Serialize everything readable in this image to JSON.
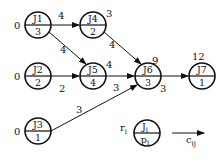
{
  "diagram": {
    "type": "job precedence graph",
    "nodes": [
      {
        "id": "J1",
        "label": "J1",
        "p": "3",
        "r": "0",
        "cx": 38,
        "cy": 25
      },
      {
        "id": "J2",
        "label": "J2",
        "p": "2",
        "r": "0",
        "cx": 38,
        "cy": 76
      },
      {
        "id": "J3",
        "label": "J3",
        "p": "1",
        "r": "0",
        "cx": 38,
        "cy": 131
      },
      {
        "id": "J4",
        "label": "J4",
        "p": "2",
        "r": "3",
        "cx": 93,
        "cy": 25
      },
      {
        "id": "J5",
        "label": "J5",
        "p": "4",
        "r": "4",
        "cx": 93,
        "cy": 76
      },
      {
        "id": "J6",
        "label": "J6",
        "p": "3",
        "r": "9",
        "cx": 148,
        "cy": 76
      },
      {
        "id": "J7",
        "label": "J7",
        "p": "1",
        "r": "12",
        "cx": 202,
        "cy": 76
      }
    ],
    "edges": [
      {
        "from": "J1",
        "to": "J4",
        "c": "4"
      },
      {
        "from": "J1",
        "to": "J5",
        "c": "4"
      },
      {
        "from": "J2",
        "to": "J5",
        "c": "2"
      },
      {
        "from": "J4",
        "to": "J6",
        "c": "4"
      },
      {
        "from": "J5",
        "to": "J6",
        "c": "3"
      },
      {
        "from": "J3",
        "to": "J6",
        "c": "3"
      },
      {
        "from": "J6",
        "to": "J7",
        "c": "3"
      }
    ],
    "legend": {
      "node_top": "J",
      "node_top_sub": "i",
      "node_bottom": "p",
      "node_bottom_sub": "i",
      "release": "r",
      "release_sub": "i",
      "edge": "c",
      "edge_sub": "ij"
    }
  }
}
